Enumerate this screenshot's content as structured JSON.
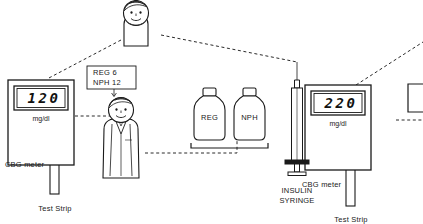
{
  "diagram": {
    "stroke_color": "#1a1a1a",
    "fill_color": "#ffffff"
  },
  "meters": [
    {
      "id": "left",
      "reading": "120",
      "unit": "mg/dl",
      "device_label": "CBG meter",
      "strip_label": "Test Strip"
    },
    {
      "id": "right",
      "reading": "220",
      "unit": "mg/dl",
      "device_label": "CBG meter",
      "strip_label": "Test Strip"
    }
  ],
  "callout": {
    "line1": "REG 6",
    "line2": "NPH 12"
  },
  "bottles": [
    {
      "label": "REG"
    },
    {
      "label": "NPH"
    }
  ],
  "syringe": {
    "label_line1": "INSULIN",
    "label_line2": "SYRINGE",
    "label": "INSULIN\nSYRINGE"
  },
  "figures": {
    "patient": "patient-figure",
    "clinician": "clinician-figure"
  }
}
